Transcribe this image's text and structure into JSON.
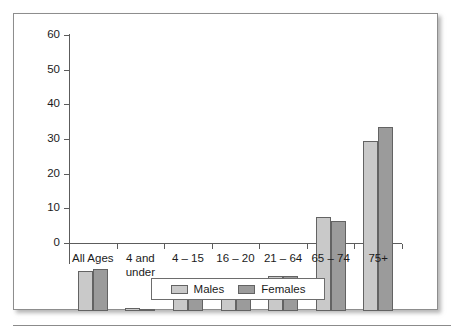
{
  "chart_data": {
    "type": "bar",
    "title": "",
    "subtitle": "",
    "xlabel": "",
    "ylabel": "",
    "ylim": [
      0,
      60
    ],
    "yticks": [
      0,
      10,
      20,
      30,
      40,
      50,
      60
    ],
    "ytick_labels": [
      "0",
      "10",
      "20",
      "30",
      "40",
      "50",
      "60"
    ],
    "grid": false,
    "legend_position": "bottom-center",
    "categories": [
      "All Ages",
      "4 and\nunder",
      "4 – 15",
      "16 – 20",
      "21 – 64",
      "65 – 74",
      "75+"
    ],
    "category_labels": [
      {
        "line1": "All Ages",
        "line2": ""
      },
      {
        "line1": "4 and",
        "line2": "under"
      },
      {
        "line1": "4 – 15",
        "line2": ""
      },
      {
        "line1": "16 – 20",
        "line2": ""
      },
      {
        "line1": "21 – 64",
        "line2": ""
      },
      {
        "line1": "65 – 74",
        "line2": ""
      },
      {
        "line1": "75+",
        "line2": ""
      }
    ],
    "series": [
      {
        "name": "Males",
        "color": "#c9c9c9",
        "values": [
          11.6,
          0.8,
          6.2,
          6.0,
          10.2,
          27.0,
          49.0
        ]
      },
      {
        "name": "Females",
        "color": "#9b9b9b",
        "values": [
          12.2,
          0.6,
          3.6,
          4.6,
          10.1,
          26.0,
          53.0
        ]
      }
    ],
    "legend": [
      {
        "label": "Males",
        "color": "#c9c9c9",
        "swatch": "males"
      },
      {
        "label": "Females",
        "color": "#9b9b9b",
        "swatch": "females"
      }
    ]
  },
  "figure": {
    "frame_border_color": "#8d8d8d",
    "axis_color": "#5c5c5c",
    "text_color": "#1b1b1b",
    "background": "#ffffff"
  }
}
